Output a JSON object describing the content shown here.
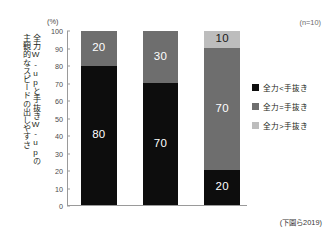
{
  "chart_data": {
    "type": "bar",
    "subtype": "100% stacked bar",
    "title": "",
    "xlabel": "",
    "ylabel": "全力W-upと手抜きW-upの主観的なスピードの出しやすさ",
    "ylabel_columns": [
      "全力W-upと手抜きW-upの",
      "主観的なスピードの出しやすさ"
    ],
    "yunit": "(%)",
    "ylim": [
      0,
      100
    ],
    "yticks": [
      0,
      10,
      20,
      30,
      40,
      50,
      60,
      70,
      80,
      90,
      100
    ],
    "ytick_labels": [
      "0",
      "10",
      "20",
      "30",
      "40",
      "50",
      "60",
      "70",
      "80",
      "90",
      "100"
    ],
    "grid": false,
    "legend_position": "right",
    "sample_size_note": "(n=10)",
    "source_note": "(下園ら2019)",
    "categories": [
      "1",
      "2",
      "3"
    ],
    "series": [
      {
        "name": "全力<手抜き",
        "color": "#0d0d0d",
        "label_color": "#ffffff",
        "values": [
          80,
          70,
          20
        ]
      },
      {
        "name": "全力=手抜き",
        "color": "#6e6e6e",
        "label_color": "#ffffff",
        "values": [
          20,
          30,
          70
        ]
      },
      {
        "name": "全力>手抜き",
        "color": "#bdbdbd",
        "label_color": "#1a1a1a",
        "values": [
          0,
          0,
          10
        ]
      }
    ],
    "bars": [
      {
        "name": "bar-1",
        "segments": [
          {
            "series": "全力<手抜き",
            "value": 80,
            "label": "80"
          },
          {
            "series": "全力=手抜き",
            "value": 20,
            "label": "20"
          }
        ]
      },
      {
        "name": "bar-2",
        "segments": [
          {
            "series": "全力<手抜き",
            "value": 70,
            "label": "70"
          },
          {
            "series": "全力=手抜き",
            "value": 30,
            "label": "30"
          }
        ]
      },
      {
        "name": "bar-3",
        "segments": [
          {
            "series": "全力<手抜き",
            "value": 20,
            "label": "20"
          },
          {
            "series": "全力=手抜き",
            "value": 70,
            "label": "70"
          },
          {
            "series": "全力>手抜き",
            "value": 10,
            "label": "10"
          }
        ]
      }
    ]
  },
  "colors": {
    "background": "#ffffff",
    "axis": "#9a9a9a",
    "tick_text": "#4c4a4b",
    "note_text": "#6d6b6c",
    "series_black": "#0d0d0d",
    "series_dark_gray": "#6e6e6e",
    "series_light_gray": "#bdbdbd"
  }
}
